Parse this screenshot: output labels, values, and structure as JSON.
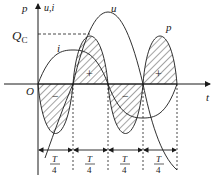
{
  "figure": {
    "type": "capacitor power waveform diagram",
    "axes": {
      "vertical_label_p": "p",
      "vertical_label_ui": "u,i",
      "horizontal_label": "t",
      "origin_label": "O"
    },
    "curves": {
      "u_label": "u",
      "i_label": "i",
      "p_label": "p"
    },
    "level_label": "Q",
    "level_label_sub": "C",
    "signs": [
      "−",
      "+",
      "−",
      "+"
    ],
    "intervals": [
      {
        "num": "T",
        "den": "4"
      },
      {
        "num": "T",
        "den": "4"
      },
      {
        "num": "T",
        "den": "4"
      },
      {
        "num": "T",
        "den": "4"
      }
    ],
    "colors": {
      "ink": "#1a1a1a",
      "background": "#ffffff"
    }
  }
}
